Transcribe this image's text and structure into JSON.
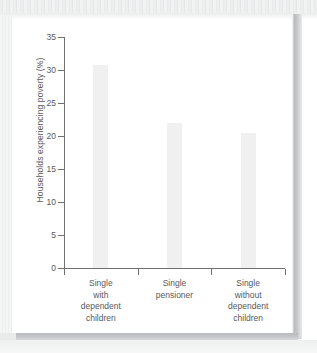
{
  "page": {
    "background_color": "#ffffff",
    "card_color": "#ffffff",
    "scan_shadow_color": "#b9babb"
  },
  "chart_data": {
    "type": "bar",
    "title": "",
    "subtitle": "",
    "xlabel": "",
    "ylabel": "Households experiencing poverty (%)",
    "categories": [
      "Single with dependent children",
      "Single pensioner",
      "Single without dependent children"
    ],
    "category_lines": [
      [
        "Single",
        "with",
        "dependent",
        "children"
      ],
      [
        "Single",
        "pensioner"
      ],
      [
        "Single",
        "without",
        "dependent",
        "children"
      ]
    ],
    "values": [
      30.8,
      21.9,
      20.4
    ],
    "ylim": [
      0,
      35
    ],
    "ytick_step": 5,
    "ytick_labels": [
      "0",
      "5",
      "10",
      "15",
      "20",
      "25",
      "30",
      "35"
    ],
    "grid": false,
    "legend": false,
    "bar_color": "#f0f0f0",
    "axis_color": "#6f7072",
    "text_color": "#58595b"
  }
}
